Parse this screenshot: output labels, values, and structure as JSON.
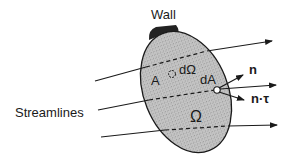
{
  "diagram": {
    "labels": {
      "wall": "Wall",
      "streamlines": "Streamlines",
      "surface_area": "A",
      "volume_element": "dΩ",
      "area_element": "dA",
      "normal": "n",
      "stress": "n·τ",
      "volume": "Ω"
    },
    "colors": {
      "region_fill": "#bdbdbd",
      "wall_fill": "#222222",
      "line": "#1a1a1a"
    },
    "streamline_count": 3
  }
}
